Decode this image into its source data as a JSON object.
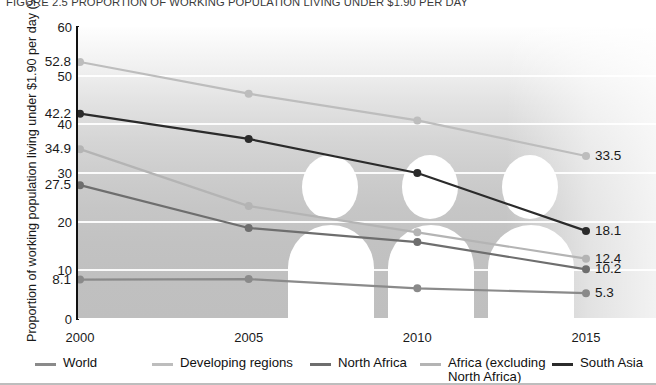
{
  "figure": {
    "title": "FIGURE 2.5  PROPORTION OF WORKING POPULATION LIVING UNDER $1.90 PER DAY"
  },
  "chart_data": {
    "type": "line",
    "title": "FIGURE 2.5  PROPORTION OF WORKING POPULATION LIVING UNDER $1.90 PER DAY",
    "xlabel": "",
    "ylabel": "Proportion of working population living under $1.90 per day (%)",
    "x": [
      "2000",
      "2005",
      "2010",
      "2015"
    ],
    "ylim": [
      0,
      60
    ],
    "yticks": [
      "0",
      "10",
      "20",
      "30",
      "40",
      "50",
      "60"
    ],
    "grid": "horizontal",
    "legend_position": "bottom",
    "series": [
      {
        "name": "World",
        "color": "#8a8a8a",
        "values": [
          8.1,
          8.2,
          6.3,
          5.3
        ],
        "start_label": "8.1",
        "end_label": "5.3"
      },
      {
        "name": "Developing regions",
        "color": "#bdbdbd",
        "values": [
          52.8,
          46.3,
          40.8,
          33.5
        ],
        "start_label": "52.8",
        "end_label": "33.5"
      },
      {
        "name": "North Africa",
        "color": "#6e6e6e",
        "values": [
          27.5,
          18.7,
          15.8,
          10.2
        ],
        "start_label": "27.5",
        "end_label": "10.2"
      },
      {
        "name": "Africa (excluding\nNorth Africa)",
        "color": "#b4b4b4",
        "values": [
          34.9,
          23.2,
          17.8,
          12.4
        ],
        "start_label": "34.9",
        "end_label": "12.4"
      },
      {
        "name": "South Asia",
        "color": "#2b2b2b",
        "values": [
          42.2,
          37.0,
          30.0,
          18.1
        ],
        "start_label": "42.2",
        "end_label": "18.1"
      }
    ]
  },
  "legend": {
    "items": [
      {
        "label": "World",
        "color": "#8a8a8a"
      },
      {
        "label": "Developing regions",
        "color": "#bdbdbd"
      },
      {
        "label": "North Africa",
        "color": "#6e6e6e"
      },
      {
        "label": "Africa (excluding\nNorth Africa)",
        "color": "#b4b4b4"
      },
      {
        "label": "South Asia",
        "color": "#2b2b2b"
      }
    ]
  }
}
